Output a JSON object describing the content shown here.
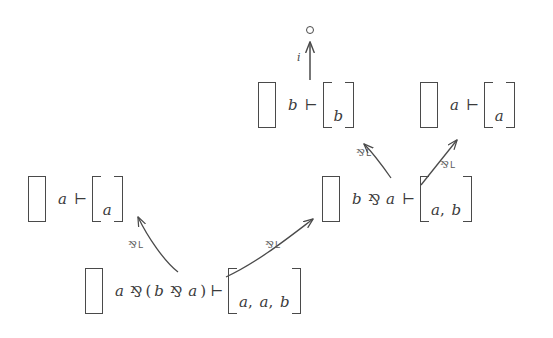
{
  "diagram": {
    "colors": {
      "ink": "#3b3b3b",
      "bracket": "#4a4a4a",
      "edge": "#4a4a4a",
      "label": "#5a5a5a",
      "background": "#ffffff"
    },
    "symbols": {
      "turnstile": "⊢",
      "par": "⅋",
      "empty_context": "[ ]",
      "goal": "∘",
      "paren_open": "(",
      "paren_close": ")",
      "comma": ","
    },
    "nodes": [
      {
        "id": "goal",
        "kind": "goal-marker",
        "label": "∘",
        "x": 309,
        "y": 26
      },
      {
        "id": "seq-b-b",
        "kind": "sequent",
        "context": "[ ]",
        "left": "b",
        "turnstile": "⊢",
        "right_items": [
          "b"
        ],
        "text": "[ ] b ⊢ [b]",
        "x": 258,
        "y": 82
      },
      {
        "id": "seq-a-a-top",
        "kind": "sequent",
        "context": "[ ]",
        "left": "a",
        "turnstile": "⊢",
        "right_items": [
          "a"
        ],
        "text": "[ ] a ⊢ [a]",
        "x": 420,
        "y": 82
      },
      {
        "id": "seq-a-a-left",
        "kind": "sequent",
        "context": "[ ]",
        "left": "a",
        "turnstile": "⊢",
        "right_items": [
          "a"
        ],
        "text": "[ ] a ⊢ [a]",
        "x": 28,
        "y": 176
      },
      {
        "id": "seq-bpara",
        "kind": "sequent",
        "context": "[ ]",
        "left": "b ⅋ a",
        "turnstile": "⊢",
        "right_items": [
          "a",
          "b"
        ],
        "text": "[ ] b ⅋ a ⊢ [a, b]",
        "x": 322,
        "y": 176
      },
      {
        "id": "seq-root",
        "kind": "sequent",
        "context": "[ ]",
        "left": "a ⅋ (b ⅋ a)",
        "turnstile": "⊢",
        "right_items": [
          "a",
          "a",
          "b"
        ],
        "text": "[ ] a ⅋ (b ⅋ a) ⊢ [a, a, b]",
        "x": 85,
        "y": 268
      }
    ],
    "edges": [
      {
        "id": "edge-init",
        "from": "seq-b-b",
        "to": "goal",
        "rule": "i",
        "label_text": "i",
        "label_kind": "axiom",
        "label_x": 297,
        "label_y": 55,
        "shape": "straight-vertical"
      },
      {
        "id": "edge-parL-1",
        "from": "seq-bpara",
        "to": "seq-b-b",
        "rule": "⅋L",
        "label_par": "⅋",
        "label_sub": "L",
        "label_x": 358,
        "label_y": 148,
        "shape": "curve"
      },
      {
        "id": "edge-parL-2",
        "from": "seq-bpara",
        "to": "seq-a-a-top",
        "rule": "⅋L",
        "label_par": "⅋",
        "label_sub": "L",
        "label_x": 440,
        "label_y": 160,
        "shape": "straight"
      },
      {
        "id": "edge-parL-3",
        "from": "seq-root",
        "to": "seq-a-a-left",
        "rule": "⅋L",
        "label_par": "⅋",
        "label_sub": "L",
        "label_x": 128,
        "label_y": 240,
        "shape": "curve"
      },
      {
        "id": "edge-parL-4",
        "from": "seq-root",
        "to": "seq-bpara",
        "rule": "⅋L",
        "label_par": "⅋",
        "label_sub": "L",
        "label_x": 265,
        "label_y": 240,
        "shape": "curve"
      }
    ]
  }
}
